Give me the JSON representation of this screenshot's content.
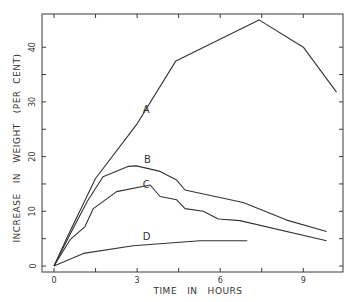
{
  "chart_data": {
    "type": "line",
    "title": "",
    "xlabel": "TIME   IN   HOURS",
    "ylabel": "INCREASE   IN   WEIGHT   (PER  CENT)",
    "xlim": [
      0,
      10.5
    ],
    "ylim": [
      0,
      46
    ],
    "x_ticks": [
      0,
      1.5,
      3,
      4.5,
      6,
      7.5,
      9
    ],
    "x_tick_labels": [
      "0",
      "",
      "3",
      "",
      "6",
      "",
      "9"
    ],
    "y_ticks": [
      0,
      5,
      10,
      15,
      20,
      25,
      30,
      35,
      40
    ],
    "y_tick_labels": [
      "0",
      "",
      "10",
      "",
      "20",
      "",
      "30",
      "",
      "40"
    ],
    "grid": false,
    "legend": "inline labels",
    "series": [
      {
        "name": "A",
        "label_pos": [
          3.2,
          28
        ],
        "points": [
          [
            0,
            0
          ],
          [
            0.5,
            5.5
          ],
          [
            1.5,
            16
          ],
          [
            3,
            26
          ],
          [
            4.4,
            37.5
          ],
          [
            7.4,
            45
          ],
          [
            9,
            40
          ],
          [
            10.2,
            31.8
          ]
        ]
      },
      {
        "name": "B",
        "label_pos": [
          3.25,
          18.8
        ],
        "points": [
          [
            0,
            0
          ],
          [
            0.6,
            6
          ],
          [
            1.2,
            11.8
          ],
          [
            1.77,
            16.3
          ],
          [
            2.67,
            18.2
          ],
          [
            2.98,
            18.3
          ],
          [
            3.83,
            17.3
          ],
          [
            4.43,
            15.7
          ],
          [
            4.73,
            13.9
          ],
          [
            5.27,
            13.3
          ],
          [
            6.83,
            11.6
          ],
          [
            8.4,
            8.4
          ],
          [
            9.84,
            6.3
          ]
        ]
      },
      {
        "name": "C",
        "label_pos": [
          3.2,
          14.2
        ],
        "points": [
          [
            0,
            0
          ],
          [
            0.58,
            4.8
          ],
          [
            1.12,
            7.2
          ],
          [
            1.42,
            10.5
          ],
          [
            2.26,
            13.6
          ],
          [
            3.47,
            14.8
          ],
          [
            3.83,
            12.7
          ],
          [
            4.43,
            12.1
          ],
          [
            4.73,
            10.5
          ],
          [
            5.39,
            10.0
          ],
          [
            5.93,
            8.6
          ],
          [
            6.71,
            8.3
          ],
          [
            9.84,
            4.6
          ]
        ]
      },
      {
        "name": "D",
        "label_pos": [
          3.2,
          4.8
        ],
        "points": [
          [
            0,
            0
          ],
          [
            1.06,
            2.3
          ],
          [
            2.86,
            3.7
          ],
          [
            5.27,
            4.6
          ],
          [
            6.98,
            4.6
          ]
        ]
      }
    ]
  },
  "plot_area": {
    "left_px": 54,
    "right_px": 343,
    "top_px": 14,
    "bottom_px": 266,
    "x0_px": 54,
    "px_per_x": 27.7,
    "y0_px": 266,
    "px_per_y": 5.47
  }
}
